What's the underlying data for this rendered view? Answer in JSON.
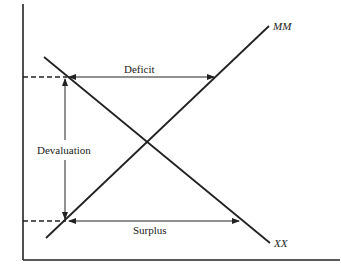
{
  "diagram": {
    "type": "economics-supply-demand-cross",
    "colors": {
      "line": "#222222",
      "background": "#ffffff"
    },
    "axes": {
      "y_axis": {
        "x": 23,
        "y_top": 4,
        "y_bottom": 260
      },
      "x_axis": {
        "y": 260,
        "x_left": 23,
        "x_right": 340
      }
    },
    "curves": [
      {
        "id": "MM",
        "label": "MM",
        "x1": 46,
        "y1": 238,
        "x2": 269,
        "y2": 26
      },
      {
        "id": "XX",
        "label": "XX",
        "x1": 44,
        "y1": 57,
        "x2": 270,
        "y2": 243
      }
    ],
    "labels": {
      "mm": "MM",
      "xx": "XX",
      "deficit": "Deficit",
      "surplus": "Surplus",
      "devaluation": "Devaluation"
    },
    "levels": {
      "upper": {
        "y": 77,
        "dash_from": 23,
        "dash_to": 67,
        "arrow_to": 215
      },
      "lower": {
        "y": 221,
        "dash_from": 23,
        "dash_to": 67,
        "arrow_to": 240
      }
    },
    "devaluation_arrow": {
      "x": 65,
      "y_from": 79,
      "y_to": 219
    }
  }
}
